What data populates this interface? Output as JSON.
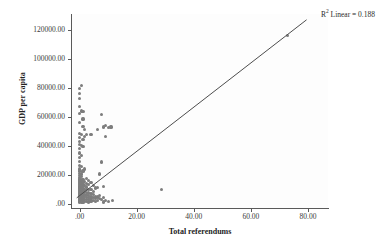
{
  "chart_data": {
    "type": "scatter",
    "title": "",
    "xlabel": "Total referendums",
    "ylabel": "GDP per capita",
    "xlim": [
      -3,
      87
    ],
    "ylim": [
      -3000,
      131000
    ],
    "grid": false,
    "legend": "none",
    "annotations": [
      {
        "name": "r2-linear",
        "prefix": "R",
        "superscript": "2",
        "text": " Linear = 0.188",
        "value": 0.188,
        "position": "top-right"
      }
    ],
    "xticks": [
      {
        "value": 0,
        "label": ".00"
      },
      {
        "value": 20,
        "label": "20.00"
      },
      {
        "value": 40,
        "label": "40.00"
      },
      {
        "value": 60,
        "label": "60.00"
      },
      {
        "value": 80,
        "label": "80.00"
      }
    ],
    "yticks": [
      {
        "value": 0,
        "label": ".00"
      },
      {
        "value": 20000,
        "label": "20000.00"
      },
      {
        "value": 40000,
        "label": "40000.00"
      },
      {
        "value": 60000,
        "label": "60000.00"
      },
      {
        "value": 80000,
        "label": "80000.00"
      },
      {
        "value": 100000,
        "label": "100000.00"
      },
      {
        "value": 120000,
        "label": "120000.00"
      }
    ],
    "fit_line": {
      "type": "linear",
      "r_squared": 0.188,
      "x_start": -1.0,
      "y_start": 4000,
      "x_end": 79.5,
      "y_end": 127000,
      "color": "#4d4d4d"
    },
    "marker": {
      "shape": "circle",
      "color": "#7d7d7d",
      "size_px": 3.2
    },
    "points": [
      [
        0.0,
        1200
      ],
      [
        0.0,
        1800
      ],
      [
        0.0,
        2400
      ],
      [
        0.0,
        3000
      ],
      [
        0.0,
        3600
      ],
      [
        0.0,
        4200
      ],
      [
        0.0,
        4800
      ],
      [
        0.0,
        5400
      ],
      [
        0.0,
        6000
      ],
      [
        0.0,
        6600
      ],
      [
        0.0,
        7200
      ],
      [
        0.0,
        7800
      ],
      [
        0.0,
        8400
      ],
      [
        0.0,
        9000
      ],
      [
        0.0,
        9600
      ],
      [
        0.0,
        10200
      ],
      [
        0.0,
        10800
      ],
      [
        0.0,
        11500
      ],
      [
        0.0,
        12200
      ],
      [
        0.0,
        13000
      ],
      [
        0.0,
        13800
      ],
      [
        0.0,
        14600
      ],
      [
        0.0,
        15400
      ],
      [
        0.0,
        16200
      ],
      [
        0.0,
        17000
      ],
      [
        0.0,
        18000
      ],
      [
        0.0,
        19500
      ],
      [
        0.0,
        21000
      ],
      [
        0.0,
        22500
      ],
      [
        0.0,
        24000
      ],
      [
        0.0,
        26500
      ],
      [
        0.0,
        29000
      ],
      [
        0.0,
        32000
      ],
      [
        0.0,
        35000
      ],
      [
        0.0,
        38000
      ],
      [
        0.0,
        41000
      ],
      [
        0.0,
        43000
      ],
      [
        0.0,
        45500
      ],
      [
        0.0,
        48500
      ],
      [
        0.0,
        56000
      ],
      [
        0.0,
        62500
      ],
      [
        0.0,
        67000
      ],
      [
        0.0,
        72500
      ],
      [
        0.0,
        76000
      ],
      [
        0.0,
        79500
      ],
      [
        0.6,
        1000
      ],
      [
        0.6,
        2000
      ],
      [
        0.6,
        3200
      ],
      [
        0.6,
        4500
      ],
      [
        0.6,
        5600
      ],
      [
        0.6,
        6800
      ],
      [
        0.6,
        8000
      ],
      [
        0.6,
        9200
      ],
      [
        0.6,
        10500
      ],
      [
        0.6,
        12000
      ],
      [
        0.6,
        13500
      ],
      [
        0.6,
        15000
      ],
      [
        0.6,
        16800
      ],
      [
        0.6,
        18500
      ],
      [
        0.6,
        20500
      ],
      [
        0.6,
        25500
      ],
      [
        0.6,
        33000
      ],
      [
        0.6,
        40000
      ],
      [
        0.6,
        47500
      ],
      [
        0.6,
        64000
      ],
      [
        0.6,
        81500
      ],
      [
        1.2,
        900
      ],
      [
        1.2,
        2200
      ],
      [
        1.2,
        3500
      ],
      [
        1.2,
        4900
      ],
      [
        1.2,
        6200
      ],
      [
        1.2,
        7600
      ],
      [
        1.2,
        9000
      ],
      [
        1.2,
        10400
      ],
      [
        1.2,
        11800
      ],
      [
        1.2,
        13200
      ],
      [
        1.2,
        14800
      ],
      [
        1.2,
        16500
      ],
      [
        1.2,
        22500
      ],
      [
        1.2,
        39500
      ],
      [
        1.2,
        44500
      ],
      [
        1.2,
        53500
      ],
      [
        1.2,
        58500
      ],
      [
        1.2,
        63500
      ],
      [
        1.8,
        1500
      ],
      [
        1.8,
        3000
      ],
      [
        1.8,
        4800
      ],
      [
        1.8,
        6500
      ],
      [
        1.8,
        8200
      ],
      [
        1.8,
        10000
      ],
      [
        1.8,
        12500
      ],
      [
        1.8,
        15500
      ],
      [
        1.8,
        24000
      ],
      [
        1.8,
        46500
      ],
      [
        1.8,
        51000
      ],
      [
        2.5,
        1300
      ],
      [
        2.5,
        2800
      ],
      [
        2.5,
        4400
      ],
      [
        2.5,
        6000
      ],
      [
        2.5,
        7800
      ],
      [
        2.5,
        9500
      ],
      [
        2.5,
        11500
      ],
      [
        2.5,
        14000
      ],
      [
        2.5,
        17500
      ],
      [
        2.5,
        48000
      ],
      [
        3.2,
        1100
      ],
      [
        3.2,
        2600
      ],
      [
        3.2,
        4200
      ],
      [
        3.2,
        5800
      ],
      [
        3.2,
        7400
      ],
      [
        3.2,
        9600
      ],
      [
        3.2,
        13000
      ],
      [
        3.2,
        16000
      ],
      [
        4.0,
        1800
      ],
      [
        4.0,
        3400
      ],
      [
        4.0,
        5200
      ],
      [
        4.0,
        7000
      ],
      [
        4.0,
        9800
      ],
      [
        4.0,
        14500
      ],
      [
        4.0,
        47500
      ],
      [
        4.8,
        2000
      ],
      [
        4.8,
        4000
      ],
      [
        4.8,
        6400
      ],
      [
        4.8,
        8600
      ],
      [
        4.8,
        12500
      ],
      [
        5.5,
        1600
      ],
      [
        5.5,
        3800
      ],
      [
        5.5,
        5000
      ],
      [
        5.5,
        10800
      ],
      [
        6.2,
        2400
      ],
      [
        6.2,
        4600
      ],
      [
        6.2,
        11200
      ],
      [
        6.2,
        51500
      ],
      [
        7.0,
        3600
      ],
      [
        7.0,
        5400
      ],
      [
        7.0,
        20500
      ],
      [
        7.8,
        2900
      ],
      [
        7.8,
        28800
      ],
      [
        7.8,
        61500
      ],
      [
        8.5,
        1200
      ],
      [
        8.5,
        4300
      ],
      [
        8.5,
        12000
      ],
      [
        8.5,
        53000
      ],
      [
        9.2,
        2100
      ],
      [
        9.2,
        46500
      ],
      [
        9.2,
        54000
      ],
      [
        10.0,
        1500
      ],
      [
        10.0,
        52500
      ],
      [
        11.0,
        53000
      ],
      [
        11.5,
        2000
      ],
      [
        28.8,
        10000
      ],
      [
        72.8,
        116000
      ]
    ]
  }
}
